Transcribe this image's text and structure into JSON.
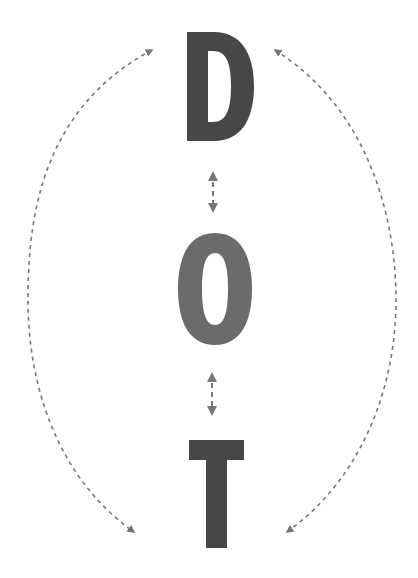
{
  "diagram": {
    "title": "DOT",
    "letters": [
      {
        "char": "D",
        "color": "#474747"
      },
      {
        "char": "O",
        "color": "#6b6b6b"
      },
      {
        "char": "T",
        "color": "#474747"
      }
    ],
    "connectors": {
      "color": "#777777",
      "style": "dashed",
      "vertical_arrows": [
        {
          "from": "D",
          "to": "O",
          "type": "bidirectional"
        },
        {
          "from": "O",
          "to": "T",
          "type": "bidirectional"
        }
      ],
      "outer_arcs": [
        {
          "side": "left",
          "from": "D",
          "to": "T",
          "type": "bidirectional"
        },
        {
          "side": "right",
          "from": "D",
          "to": "T",
          "type": "bidirectional"
        }
      ]
    },
    "background": "#ffffff"
  }
}
